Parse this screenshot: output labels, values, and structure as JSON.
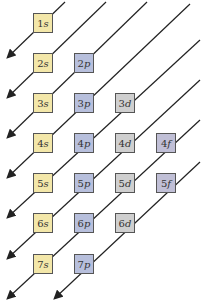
{
  "colors": {
    "s": "#f3e7a9",
    "p": "#b7bfdc",
    "d": "#cfcfcf",
    "f": "#c0bfd6",
    "line": "#222222"
  },
  "orbitals": [
    {
      "n": "1",
      "l": "s",
      "row": 0,
      "col": 0
    },
    {
      "n": "2",
      "l": "s",
      "row": 1,
      "col": 0
    },
    {
      "n": "2",
      "l": "p",
      "row": 1,
      "col": 1
    },
    {
      "n": "3",
      "l": "s",
      "row": 2,
      "col": 0
    },
    {
      "n": "3",
      "l": "p",
      "row": 2,
      "col": 1
    },
    {
      "n": "3",
      "l": "d",
      "row": 2,
      "col": 2
    },
    {
      "n": "4",
      "l": "s",
      "row": 3,
      "col": 0
    },
    {
      "n": "4",
      "l": "p",
      "row": 3,
      "col": 1
    },
    {
      "n": "4",
      "l": "d",
      "row": 3,
      "col": 2
    },
    {
      "n": "4",
      "l": "f",
      "row": 3,
      "col": 3
    },
    {
      "n": "5",
      "l": "s",
      "row": 4,
      "col": 0
    },
    {
      "n": "5",
      "l": "p",
      "row": 4,
      "col": 1
    },
    {
      "n": "5",
      "l": "d",
      "row": 4,
      "col": 2
    },
    {
      "n": "5",
      "l": "f",
      "row": 4,
      "col": 3
    },
    {
      "n": "6",
      "l": "s",
      "row": 5,
      "col": 0
    },
    {
      "n": "6",
      "l": "p",
      "row": 5,
      "col": 1
    },
    {
      "n": "6",
      "l": "d",
      "row": 5,
      "col": 2
    },
    {
      "n": "7",
      "l": "s",
      "row": 6,
      "col": 0
    },
    {
      "n": "7",
      "l": "p",
      "row": 6,
      "col": 1
    }
  ]
}
